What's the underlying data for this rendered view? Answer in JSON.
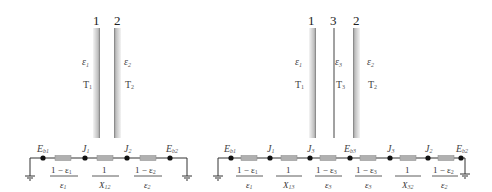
{
  "left_diagram": {
    "plates": [
      {
        "number": "1",
        "emissivity": "ε₁",
        "emissivity_symbol": "ε",
        "emissivity_sub": "1",
        "temperature": "T₁",
        "temperature_symbol": "T",
        "temperature_sub": "1"
      },
      {
        "number": "2",
        "emissivity": "ε₂",
        "emissivity_symbol": "ε",
        "emissivity_sub": "2",
        "temperature": "T₂",
        "temperature_symbol": "T",
        "temperature_sub": "2"
      }
    ],
    "circuit": {
      "nodes": [
        {
          "label": "E",
          "sub": "b1"
        },
        {
          "label": "J",
          "sub": "1"
        },
        {
          "label": "J",
          "sub": "2"
        },
        {
          "label": "E",
          "sub": "b2"
        }
      ],
      "resistances": [
        {
          "numerator": "1 − ε",
          "numerator_sub": "1",
          "denominator": "ε",
          "denominator_sub": "1"
        },
        {
          "numerator": "1",
          "numerator_sub": "",
          "denominator": "X",
          "denominator_sub": "12"
        },
        {
          "numerator": "1 − ε",
          "numerator_sub": "2",
          "denominator": "ε",
          "denominator_sub": "2"
        }
      ]
    }
  },
  "right_diagram": {
    "plates": [
      {
        "number": "1",
        "emissivity_symbol": "ε",
        "emissivity_sub": "1",
        "temperature_symbol": "T",
        "temperature_sub": "1"
      },
      {
        "number": "3",
        "emissivity_symbol": "ε",
        "emissivity_sub": "3",
        "temperature_symbol": "T",
        "temperature_sub": "3"
      },
      {
        "number": "2",
        "emissivity_symbol": "ε",
        "emissivity_sub": "2",
        "temperature_symbol": "T",
        "temperature_sub": "2"
      }
    ],
    "circuit": {
      "nodes": [
        {
          "label": "E",
          "sub": "b1"
        },
        {
          "label": "J",
          "sub": "1"
        },
        {
          "label": "J",
          "sub": "3"
        },
        {
          "label": "E",
          "sub": "b3"
        },
        {
          "label": "J",
          "sub": "3"
        },
        {
          "label": "J",
          "sub": "2"
        },
        {
          "label": "E",
          "sub": "b2"
        }
      ],
      "resistances": [
        {
          "numerator": "1 − ε",
          "numerator_sub": "1",
          "denominator": "ε",
          "denominator_sub": "1"
        },
        {
          "numerator": "1",
          "numerator_sub": "",
          "denominator": "X",
          "denominator_sub": "13"
        },
        {
          "numerator": "1 − ε",
          "numerator_sub": "3",
          "denominator": "ε",
          "denominator_sub": "3"
        },
        {
          "numerator": "1 − ε",
          "numerator_sub": "3",
          "denominator": "ε",
          "denominator_sub": "3"
        },
        {
          "numerator": "1",
          "numerator_sub": "",
          "denominator": "X",
          "denominator_sub": "32"
        },
        {
          "numerator": "1 − ε",
          "numerator_sub": "2",
          "denominator": "ε",
          "denominator_sub": "2"
        }
      ]
    }
  },
  "colors": {
    "plate_dark": "#8a8a8a",
    "plate_light": "#f2f2f2",
    "wire": "#333333",
    "resistor": "#b0b0b0",
    "node": "#111111"
  }
}
